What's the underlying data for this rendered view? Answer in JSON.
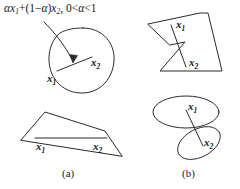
{
  "figure": {
    "formula": {
      "alpha": "α",
      "text": "αx₁+(1−α)x₂, 0<α<1",
      "parts": {
        "a1": "α",
        "x": "x",
        "sub1": "1",
        "plus": "+(1−",
        "a2": "α",
        "close": ")",
        "x2": "x",
        "sub2": "2",
        "tail": ", 0<",
        "a3": "α",
        "end": "<1"
      }
    },
    "point_labels": {
      "x1": "x",
      "x1_sub": "1",
      "x2": "x",
      "x2_sub": "2"
    },
    "panels": [
      {
        "id": "a",
        "caption": "(a)",
        "description": "convex sets"
      },
      {
        "id": "b",
        "caption": "(b)",
        "description": "nonconvex sets"
      }
    ],
    "shapes": {
      "convex_blob": "closed smooth egg-shaped convex region",
      "convex_quadrilateral": "convex four-sided polygon",
      "nonconvex_polygon": "arrowhead polygon with concave notch",
      "two_ellipses": "two tangent ellipses forming a nonconvex union"
    },
    "colors": {
      "stroke": "#2b2b2b",
      "text": "#1a1a1a",
      "background": "#ffffff"
    }
  }
}
